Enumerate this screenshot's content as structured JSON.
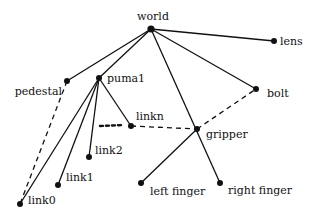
{
  "diagram": {
    "type": "tree",
    "nodes": [
      {
        "id": "world",
        "label": "world",
        "x": 151,
        "y": 29,
        "lx": 153,
        "ly": 20,
        "anchor": "middle"
      },
      {
        "id": "lens",
        "label": "lens",
        "x": 274,
        "y": 41,
        "lx": 280,
        "ly": 45,
        "anchor": "start"
      },
      {
        "id": "pedestal",
        "label": "pedestal",
        "x": 67,
        "y": 81,
        "lx": 62,
        "ly": 95,
        "anchor": "end"
      },
      {
        "id": "puma1",
        "label": "puma1",
        "x": 99,
        "y": 78,
        "lx": 107,
        "ly": 82,
        "anchor": "start"
      },
      {
        "id": "bolt",
        "label": "bolt",
        "x": 256,
        "y": 89,
        "lx": 267,
        "ly": 97,
        "anchor": "start"
      },
      {
        "id": "linkn",
        "label": "linkn",
        "x": 131,
        "y": 126,
        "lx": 136,
        "ly": 120,
        "anchor": "start"
      },
      {
        "id": "gripper",
        "label": "gripper",
        "x": 197,
        "y": 129,
        "lx": 206,
        "ly": 138,
        "anchor": "start"
      },
      {
        "id": "link2",
        "label": "link2",
        "x": 89,
        "y": 157,
        "lx": 95,
        "ly": 154,
        "anchor": "start"
      },
      {
        "id": "link1",
        "label": "link1",
        "x": 58,
        "y": 185,
        "lx": 66,
        "ly": 181,
        "anchor": "start"
      },
      {
        "id": "link0",
        "label": "link0",
        "x": 20,
        "y": 204,
        "lx": 28,
        "ly": 204,
        "anchor": "start"
      },
      {
        "id": "left_finger",
        "label": "left finger",
        "x": 141,
        "y": 183,
        "lx": 150,
        "ly": 195,
        "anchor": "start"
      },
      {
        "id": "right_finger",
        "label": "right finger",
        "x": 220,
        "y": 183,
        "lx": 228,
        "ly": 194,
        "anchor": "start"
      }
    ],
    "edges": [
      {
        "from": "world",
        "to": "lens",
        "style": "solid"
      },
      {
        "from": "world",
        "to": "pedestal",
        "style": "solid"
      },
      {
        "from": "world",
        "to": "puma1",
        "style": "solid"
      },
      {
        "from": "world",
        "to": "bolt",
        "style": "solid"
      },
      {
        "from": "world",
        "to": "right_finger",
        "style": "solid"
      },
      {
        "from": "puma1",
        "to": "link0",
        "style": "solid"
      },
      {
        "from": "puma1",
        "to": "link1",
        "style": "solid"
      },
      {
        "from": "puma1",
        "to": "link2",
        "style": "solid"
      },
      {
        "from": "puma1",
        "to": "linkn",
        "style": "solid"
      },
      {
        "from": "gripper",
        "to": "left_finger",
        "style": "solid"
      },
      {
        "from": "pedestal",
        "to": "link0",
        "style": "dashed"
      },
      {
        "from": "linkn",
        "to": "gripper",
        "style": "dashed"
      },
      {
        "from": "gripper",
        "to": "bolt",
        "style": "dashed"
      }
    ],
    "ellipsis": {
      "x1": 100,
      "y1": 126,
      "x2": 123,
      "y2": 125
    }
  }
}
